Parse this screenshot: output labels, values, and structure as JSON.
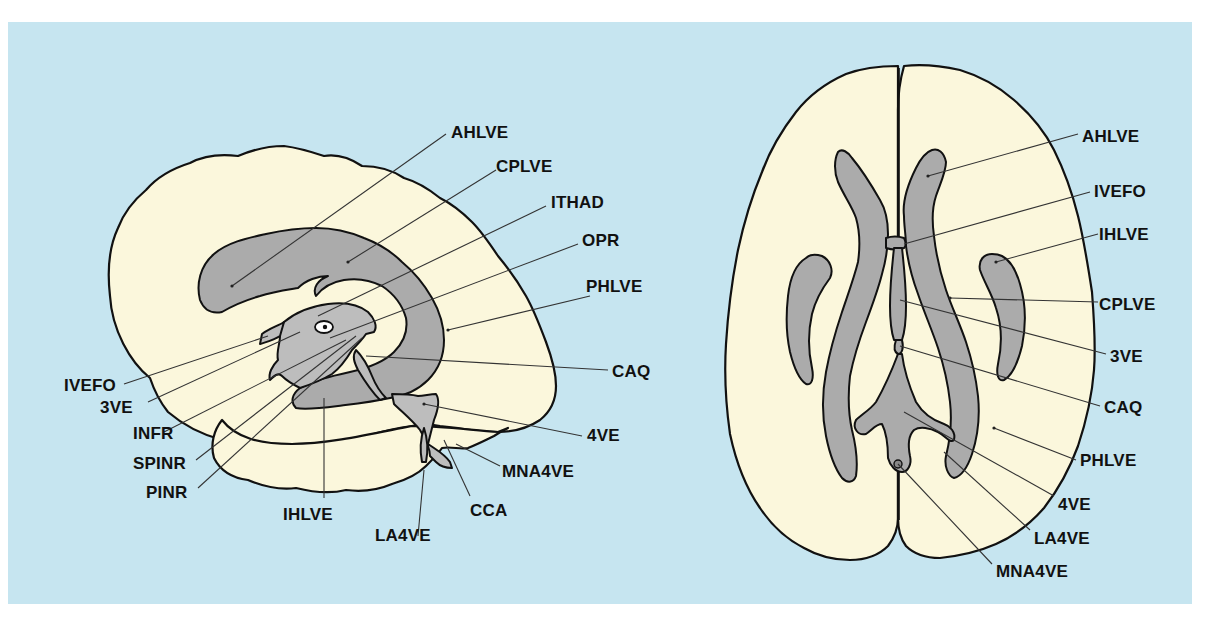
{
  "background_color": "#c6e5f0",
  "brain_fill_color": "#fbf7dc",
  "ventricle_fill_color": "#ababab",
  "sagittal_view": {
    "labels": {
      "ahlve": "AHLVE",
      "cplve": "CPLVE",
      "ithad": "ITHAD",
      "opr": "OPR",
      "phlve": "PHLVE",
      "caq": "CAQ",
      "4ve": "4VE",
      "mna4ve": "MNA4VE",
      "cca": "CCA",
      "la4ve": "LA4VE",
      "ihlve": "IHLVE",
      "pinr": "PINR",
      "spinr": "SPINR",
      "infr": "INFR",
      "3ve": "3VE",
      "ivefo": "IVEFO"
    }
  },
  "axial_view": {
    "labels": {
      "ahlve": "AHLVE",
      "ivefo": "IVEFO",
      "ihlve": "IHLVE",
      "cplve": "CPLVE",
      "3ve": "3VE",
      "caq": "CAQ",
      "phlve": "PHLVE",
      "4ve": "4VE",
      "la4ve": "LA4VE",
      "mna4ve": "MNA4VE"
    }
  }
}
